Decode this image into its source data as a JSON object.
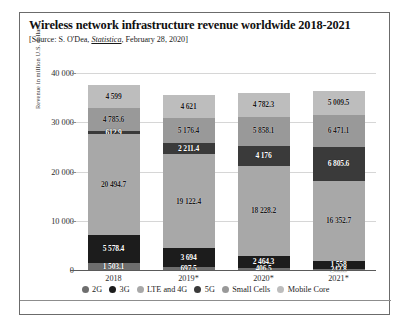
{
  "header": {
    "title": "Wireless network infrastructure revenue worldwide 2018-2021",
    "source_prefix": "[Source: S. O'Dea, ",
    "source_italic": "Statistica",
    "source_suffix": ", February 28, 2020]"
  },
  "chart_data": {
    "type": "bar",
    "stacked": true,
    "title": "Wireless network infrastructure revenue worldwide 2018-2021",
    "xlabel": "",
    "ylabel": "Revenue in million U.S. dollars",
    "categories": [
      "2018",
      "2019*",
      "2020*",
      "2021*"
    ],
    "ylim": [
      0,
      40000
    ],
    "yticks": [
      "0",
      "10 000",
      "20 000",
      "30 000",
      "40 000"
    ],
    "ytick_values": [
      0,
      10000,
      20000,
      30000,
      40000
    ],
    "grid": true,
    "legend_position": "bottom",
    "series": [
      {
        "name": "2G",
        "color": "#6e6e6e",
        "values": [
          1503.1,
          697.5,
          406.5,
          243.8
        ],
        "labels": [
          "1 503.1",
          "697.5",
          "406.5",
          "243.8"
        ]
      },
      {
        "name": "3G",
        "color": "#1c1c1c",
        "values": [
          5578.4,
          3694,
          2464.3,
          1558
        ],
        "labels": [
          "5 578.4",
          "3 694",
          "2 464.3",
          "1 558"
        ]
      },
      {
        "name": "LTE and 4G",
        "color": "#a8a8a8",
        "values": [
          20494.7,
          19122.4,
          18228.2,
          16352.7
        ],
        "labels": [
          "20 494.7",
          "19 122.4",
          "18 228.2",
          "16 352.7"
        ]
      },
      {
        "name": "5G",
        "color": "#3a3a3a",
        "values": [
          612.9,
          2211.4,
          4176,
          6805.6
        ],
        "labels": [
          "612.9",
          "2 211.4",
          "4 176",
          "6 805.6"
        ]
      },
      {
        "name": "Small Cells",
        "color": "#999999",
        "values": [
          4785.6,
          5176.4,
          5858.1,
          6471.1
        ],
        "labels": [
          "4 785.6",
          "5 176.4",
          "5 858.1",
          "6 471.1"
        ]
      },
      {
        "name": "Mobile Core",
        "color": "#bdbdbd",
        "values": [
          4599,
          4621,
          4782.3,
          5009.5
        ],
        "labels": [
          "4 599",
          "4 621",
          "4 782.3",
          "5 009.5"
        ]
      }
    ]
  }
}
